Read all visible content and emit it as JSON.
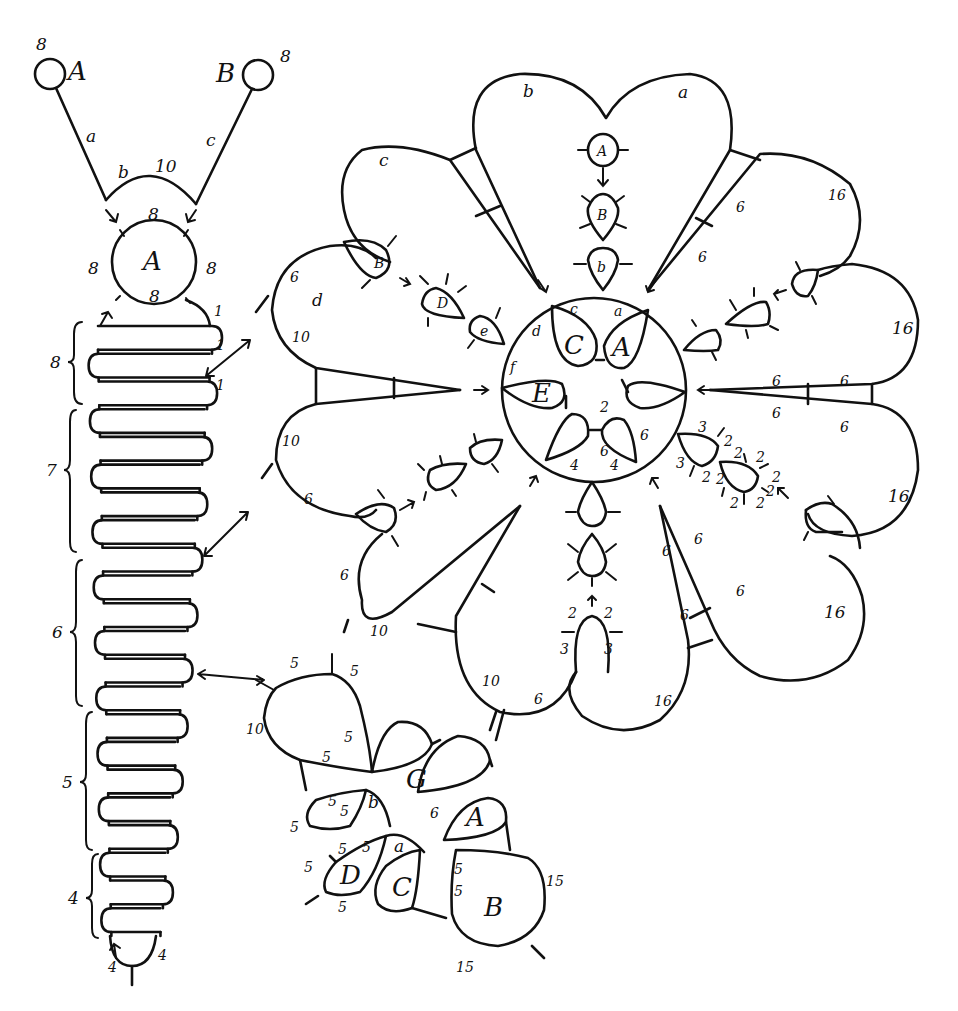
{
  "diagram": {
    "type": "tatting-pattern",
    "strip": {
      "top_rings": [
        {
          "label": "A",
          "count": "8"
        },
        {
          "label": "B",
          "count": "8"
        }
      ],
      "chains": [
        {
          "label": "a"
        },
        {
          "label": "b",
          "count": "10"
        },
        {
          "label": "c"
        }
      ],
      "center_ring": {
        "label": "A",
        "counts": {
          "top": "8",
          "left": "8",
          "right": "8",
          "bottom": "8"
        }
      },
      "joins": [
        "1",
        "1",
        "1"
      ],
      "groups": [
        {
          "label": "8"
        },
        {
          "label": "7"
        },
        {
          "label": "6"
        },
        {
          "label": "5"
        },
        {
          "label": "4"
        }
      ],
      "bottom": {
        "left": "4",
        "right": "4"
      }
    },
    "flower": {
      "petals": [
        {
          "label": "a"
        },
        {
          "label": "b"
        },
        {
          "label": "c"
        },
        {
          "label": "d"
        }
      ],
      "petal_counts": {
        "d_top": "6",
        "d_bottom": "10",
        "left_lower": "10",
        "left_lower_b": "6",
        "lower_left_6": "6",
        "lower_left_10": "10",
        "bottom_10": "10",
        "bottom_6": "6",
        "bottom_16": "16",
        "right_16_a": "16",
        "right_16_b": "16",
        "right_16_c": "16",
        "right_16_d": "16",
        "stem_6": "6"
      },
      "top_chain_rings": [
        "A",
        "B",
        "b"
      ],
      "left_chain_rings": [
        "B",
        "D",
        "e"
      ],
      "center": {
        "rings": [
          "C",
          "A",
          "E"
        ],
        "labels": {
          "c": "c",
          "a": "a",
          "d": "d",
          "f": "f",
          "two": "2",
          "six_inner": "6",
          "six_right": "6",
          "four_left": "4",
          "four_right": "4"
        }
      },
      "right_small_rings": {
        "counts": [
          "3",
          "2",
          "3",
          "2",
          "2",
          "2",
          "2",
          "2",
          "2",
          "2",
          "2"
        ]
      },
      "bottom_small_ring": {
        "counts": [
          "2",
          "2",
          "3",
          "3"
        ]
      }
    },
    "square_motif": {
      "rings": [
        "G",
        "A",
        "B",
        "C",
        "D"
      ],
      "chain_labels": [
        "b",
        "a"
      ],
      "counts": {
        "top_left": "5",
        "top_right": "5",
        "left": "10",
        "inner_1": "5",
        "inner_2": "5",
        "g6": "6",
        "a6": "6",
        "b_left_1": "5",
        "b_left_2": "5",
        "left_5": "5",
        "d_5a": "5",
        "d_5b": "5",
        "d_left": "5",
        "d_bottom": "5",
        "B_5a": "5",
        "B_5b": "5",
        "B_15_right": "15",
        "B_15_bottom": "15"
      }
    }
  }
}
